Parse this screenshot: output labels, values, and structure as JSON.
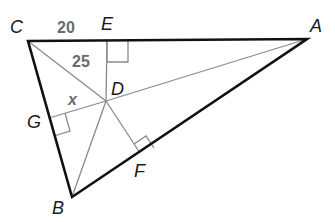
{
  "figure": {
    "type": "triangle-with-incenter",
    "vertices": {
      "C": {
        "label": "C",
        "x": 28,
        "y": 41
      },
      "A": {
        "label": "A",
        "x": 307,
        "y": 39
      },
      "B": {
        "label": "B",
        "x": 72,
        "y": 197
      }
    },
    "points": {
      "D": {
        "label": "D",
        "x": 106,
        "y": 101
      },
      "E": {
        "label": "E",
        "x": 107,
        "y": 41
      },
      "F": {
        "label": "F",
        "x": 140,
        "y": 153
      },
      "G": {
        "label": "G",
        "x": 49,
        "y": 118
      }
    },
    "measures": {
      "CE": "20",
      "DC": "25",
      "DG": "x"
    },
    "right_angles": [
      "E",
      "F",
      "G"
    ],
    "colors": {
      "triangle_stroke": "#111111",
      "inner_lines": "#8a8a8a",
      "label_gray": "#6b6b6b"
    }
  }
}
